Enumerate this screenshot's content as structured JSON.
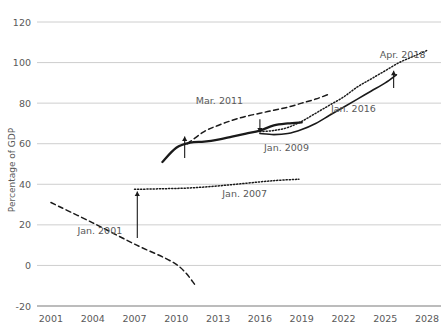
{
  "chart_data": {
    "type": "line",
    "title": "",
    "xlabel": "",
    "ylabel": "Percentage of GDP",
    "xlim": [
      2000,
      2029
    ],
    "ylim": [
      -20,
      120
    ],
    "grid": true,
    "legend": "annotations-on-lines",
    "y_ticks": [
      "120",
      "100",
      "80",
      "60",
      "40",
      "20",
      "0",
      "-20"
    ],
    "y_tick_values": [
      120,
      100,
      80,
      60,
      40,
      20,
      0,
      -20
    ],
    "x_ticks": [
      "2001",
      "2004",
      "2007",
      "2010",
      "2013",
      "2016",
      "2019",
      "2022",
      "2025",
      "2028"
    ],
    "x_tick_values": [
      2001,
      2004,
      2007,
      2010,
      2013,
      2016,
      2019,
      2022,
      2025,
      2028
    ],
    "series": [
      {
        "name": "Jan. 2001",
        "label": "Jan. 2001",
        "style": "dashed",
        "color": "#1a1a1a",
        "x": [
          2001,
          2004,
          2007,
          2010,
          2011.4
        ],
        "values": [
          31,
          21,
          10.5,
          0.5,
          -10
        ]
      },
      {
        "name": "Jan. 2007",
        "label": "Jan. 2007",
        "style": "dotted",
        "color": "#404040",
        "x": [
          2007,
          2009,
          2011,
          2013,
          2015,
          2017,
          2018.8
        ],
        "values": [
          37.5,
          37.8,
          38.2,
          39.2,
          40.5,
          41.8,
          42.5
        ]
      },
      {
        "name": "Jan. 2009",
        "label": "Jan. 2009",
        "style": "solid-thick",
        "color": "#1a1a1a",
        "x": [
          2009,
          2010,
          2011,
          2012,
          2013,
          2014,
          2015,
          2016,
          2017,
          2018,
          2019
        ],
        "values": [
          51,
          58,
          60.5,
          61,
          62,
          63.5,
          65,
          66.5,
          69,
          70,
          70.5
        ]
      },
      {
        "name": "Mar. 2011",
        "label": "Mar. 2011",
        "style": "dashed",
        "color": "#1a1a1a",
        "x": [
          2010.8,
          2012,
          2013,
          2014,
          2015,
          2016,
          2017,
          2018,
          2019,
          2020,
          2021
        ],
        "values": [
          60,
          66,
          69,
          71.5,
          73.5,
          75,
          76.5,
          78,
          80,
          82,
          84.5
        ]
      },
      {
        "name": "Jan. 2016",
        "label": "Jan. 2016",
        "style": "solid",
        "color": "#1a1a1a",
        "x": [
          2016,
          2017,
          2018,
          2019,
          2020,
          2021,
          2022,
          2023,
          2024,
          2025,
          2025.8
        ],
        "values": [
          65,
          64.5,
          65,
          67,
          70,
          74,
          78,
          82,
          86,
          90,
          94
        ]
      },
      {
        "name": "Apr. 2018",
        "label": "Apr. 2018",
        "style": "dotted",
        "color": "#808080",
        "x": [
          2016,
          2017,
          2018,
          2019,
          2020,
          2021,
          2022,
          2023,
          2024,
          2025,
          2026,
          2027,
          2028
        ],
        "values": [
          66,
          66.5,
          68,
          71,
          75,
          79,
          83,
          88,
          92,
          96,
          100,
          103,
          106
        ]
      }
    ],
    "annotations": [
      {
        "text": "Jan. 2001",
        "x": 2002.9,
        "y": 15.5
      },
      {
        "text": "Jan. 2007",
        "x": 2013.3,
        "y": 33.5
      },
      {
        "text": "Jan. 2009",
        "x": 2016.3,
        "y": 56.5
      },
      {
        "text": "Mar. 2011",
        "x": 2011.4,
        "y": 79.5
      },
      {
        "text": "Jan. 2016",
        "x": 2021.1,
        "y": 75.5
      },
      {
        "text": "Apr. 2018",
        "x": 2024.6,
        "y": 102.5
      }
    ],
    "arrows": [
      {
        "name": "arrow-2007-to-2009",
        "x": 2007.2,
        "y_from": 13.5,
        "y_to": 36.5,
        "direction": "up"
      },
      {
        "name": "arrow-2009-to-2011",
        "x": 2010.6,
        "y_from": 53.0,
        "y_to": 63.5,
        "direction": "up"
      },
      {
        "name": "arrow-2011-to-2016",
        "x": 2016.0,
        "y_from": 72.0,
        "y_to": 65.5,
        "direction": "down"
      },
      {
        "name": "arrow-2016-to-2018",
        "x": 2025.6,
        "y_from": 87.5,
        "y_to": 96.0,
        "direction": "up"
      }
    ]
  }
}
